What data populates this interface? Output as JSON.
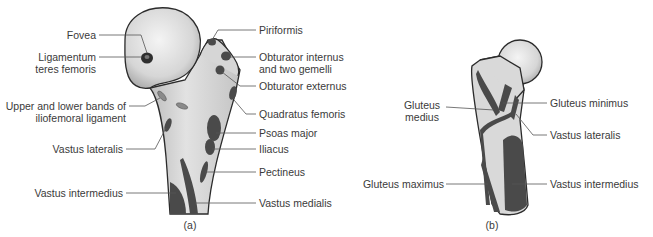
{
  "figure_a": {
    "caption": "(a)",
    "left_labels": [
      {
        "id": "fovea",
        "text": "Fovea"
      },
      {
        "id": "ligamentum",
        "text": "Ligamentum\nteres femoris"
      },
      {
        "id": "iliofemoral",
        "text": "Upper and lower bands of\niliofemoral ligament"
      },
      {
        "id": "vastus-lateralis",
        "text": "Vastus lateralis"
      },
      {
        "id": "vastus-intermedius",
        "text": "Vastus intermedius"
      }
    ],
    "right_labels": [
      {
        "id": "piriformis",
        "text": "Piriformis"
      },
      {
        "id": "obturator-internus",
        "text": "Obturator internus\nand two gemelli"
      },
      {
        "id": "obturator-externus",
        "text": "Obturator externus"
      },
      {
        "id": "quadratus-femoris",
        "text": "Quadratus femoris"
      },
      {
        "id": "psoas-major",
        "text": "Psoas major"
      },
      {
        "id": "iliacus",
        "text": "Iliacus"
      },
      {
        "id": "pectineus",
        "text": "Pectineus"
      },
      {
        "id": "vastus-medialis",
        "text": "Vastus medialis"
      }
    ]
  },
  "figure_b": {
    "caption": "(b)",
    "left_labels": [
      {
        "id": "gluteus-medius",
        "text": "Gluteus\nmedius"
      },
      {
        "id": "gluteus-maximus",
        "text": "Gluteus maximus"
      }
    ],
    "right_labels": [
      {
        "id": "gluteus-minimus",
        "text": "Gluteus minimus"
      },
      {
        "id": "vastus-lateralis",
        "text": "Vastus lateralis"
      },
      {
        "id": "vastus-intermedius",
        "text": "Vastus intermedius"
      }
    ]
  },
  "colors": {
    "bone_fill": "#d9d9d9",
    "bone_outline": "#2b2b2b",
    "muscle_attachment": "#4a4a4a",
    "leader_line": "#555555",
    "text": "#3a3a3a"
  }
}
